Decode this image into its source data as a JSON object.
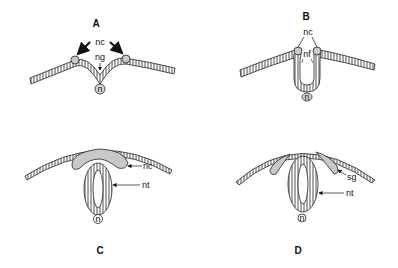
{
  "panels": [
    {
      "id": "A",
      "label": "A",
      "annotations": {
        "nc": "nc",
        "ng": "ng",
        "n": "n"
      }
    },
    {
      "id": "B",
      "label": "B",
      "annotations": {
        "nc": "nc",
        "nf": "nf",
        "n": "n"
      }
    },
    {
      "id": "C",
      "label": "C",
      "annotations": {
        "nc": "nc",
        "nt": "nt",
        "n": "n"
      }
    },
    {
      "id": "D",
      "label": "D",
      "annotations": {
        "sg": "sg",
        "nt": "nt",
        "n": "n"
      }
    }
  ],
  "colors": {
    "ink": "#111111",
    "fill_gray": "#c8c8c8",
    "background": "#ffffff"
  }
}
